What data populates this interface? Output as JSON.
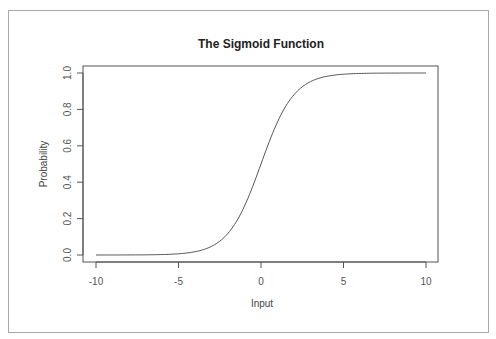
{
  "chart_data": {
    "type": "line",
    "title": "The Sigmoid Function",
    "xlabel": "Input",
    "ylabel": "Probability",
    "xlim": [
      -10,
      10
    ],
    "ylim": [
      0,
      1
    ],
    "xticks": [
      -10,
      -5,
      0,
      5,
      10
    ],
    "xtick_labels": [
      "-10",
      "-5",
      "0",
      "5",
      "10"
    ],
    "yticks": [
      0.0,
      0.2,
      0.4,
      0.6,
      0.8,
      1.0
    ],
    "ytick_labels": [
      "0.0",
      "0.2",
      "0.4",
      "0.6",
      "0.8",
      "1.0"
    ],
    "grid": false,
    "legend": null,
    "series": [
      {
        "name": "sigmoid",
        "function": "1/(1+exp(-x))",
        "x": [
          -10,
          -8,
          -6,
          -5,
          -4,
          -3,
          -2,
          -1,
          0,
          1,
          2,
          3,
          4,
          5,
          6,
          8,
          10
        ],
        "values": [
          0.0,
          0.0003,
          0.0025,
          0.0067,
          0.018,
          0.047,
          0.119,
          0.269,
          0.5,
          0.731,
          0.881,
          0.953,
          0.982,
          0.993,
          0.998,
          0.9997,
          1.0
        ]
      }
    ]
  }
}
